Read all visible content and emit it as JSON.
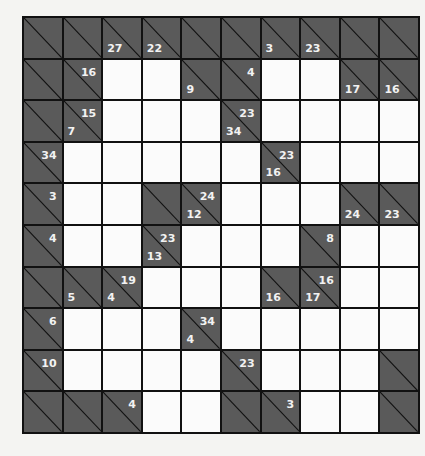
{
  "puzzle": {
    "type": "kakuro",
    "rows": 10,
    "cols": 10,
    "colors": {
      "black_cell": "#5a5a5a",
      "white_cell": "#fbfbfb",
      "grid_line": "#111111",
      "clue_text": "#f2f2f2"
    },
    "grid": [
      [
        {
          "t": "b"
        },
        {
          "t": "b"
        },
        {
          "t": "b",
          "down": "27"
        },
        {
          "t": "b",
          "down": "22"
        },
        {
          "t": "b"
        },
        {
          "t": "b"
        },
        {
          "t": "b",
          "down": "3"
        },
        {
          "t": "b",
          "down": "23"
        },
        {
          "t": "b"
        },
        {
          "t": "b"
        }
      ],
      [
        {
          "t": "b"
        },
        {
          "t": "b",
          "across": "16"
        },
        {
          "t": "w"
        },
        {
          "t": "w"
        },
        {
          "t": "b",
          "down": "9"
        },
        {
          "t": "b",
          "across": "4"
        },
        {
          "t": "w"
        },
        {
          "t": "w"
        },
        {
          "t": "b",
          "down": "17"
        },
        {
          "t": "b",
          "down": "16"
        }
      ],
      [
        {
          "t": "b"
        },
        {
          "t": "b",
          "across": "15",
          "down": "7"
        },
        {
          "t": "w"
        },
        {
          "t": "w"
        },
        {
          "t": "w"
        },
        {
          "t": "b",
          "across": "23",
          "down": "34"
        },
        {
          "t": "w"
        },
        {
          "t": "w"
        },
        {
          "t": "w"
        },
        {
          "t": "w"
        }
      ],
      [
        {
          "t": "b",
          "across": "34"
        },
        {
          "t": "w"
        },
        {
          "t": "w"
        },
        {
          "t": "w"
        },
        {
          "t": "w"
        },
        {
          "t": "w"
        },
        {
          "t": "b",
          "across": "23",
          "down": "16"
        },
        {
          "t": "w"
        },
        {
          "t": "w"
        },
        {
          "t": "w"
        }
      ],
      [
        {
          "t": "b",
          "across": "3"
        },
        {
          "t": "w"
        },
        {
          "t": "w"
        },
        {
          "t": "b"
        },
        {
          "t": "b",
          "across": "24",
          "down": "12"
        },
        {
          "t": "w"
        },
        {
          "t": "w"
        },
        {
          "t": "w"
        },
        {
          "t": "b",
          "down": "24"
        },
        {
          "t": "b",
          "down": "23"
        }
      ],
      [
        {
          "t": "b",
          "across": "4"
        },
        {
          "t": "w"
        },
        {
          "t": "w"
        },
        {
          "t": "b",
          "across": "23",
          "down": "13"
        },
        {
          "t": "w"
        },
        {
          "t": "w"
        },
        {
          "t": "w"
        },
        {
          "t": "b",
          "across": "8"
        },
        {
          "t": "w"
        },
        {
          "t": "w"
        }
      ],
      [
        {
          "t": "b"
        },
        {
          "t": "b",
          "down": "5"
        },
        {
          "t": "b",
          "across": "19",
          "down": "4"
        },
        {
          "t": "w"
        },
        {
          "t": "w"
        },
        {
          "t": "w"
        },
        {
          "t": "b",
          "down": "16"
        },
        {
          "t": "b",
          "across": "16",
          "down": "17"
        },
        {
          "t": "w"
        },
        {
          "t": "w"
        }
      ],
      [
        {
          "t": "b",
          "across": "6"
        },
        {
          "t": "w"
        },
        {
          "t": "w"
        },
        {
          "t": "w"
        },
        {
          "t": "b",
          "across": "34",
          "down": "4"
        },
        {
          "t": "w"
        },
        {
          "t": "w"
        },
        {
          "t": "w"
        },
        {
          "t": "w"
        },
        {
          "t": "w"
        }
      ],
      [
        {
          "t": "b",
          "across": "10"
        },
        {
          "t": "w"
        },
        {
          "t": "w"
        },
        {
          "t": "w"
        },
        {
          "t": "w"
        },
        {
          "t": "b",
          "across": "23"
        },
        {
          "t": "w"
        },
        {
          "t": "w"
        },
        {
          "t": "w"
        },
        {
          "t": "b"
        }
      ],
      [
        {
          "t": "b"
        },
        {
          "t": "b"
        },
        {
          "t": "b",
          "across": "4"
        },
        {
          "t": "w"
        },
        {
          "t": "w"
        },
        {
          "t": "b"
        },
        {
          "t": "b",
          "across": "3"
        },
        {
          "t": "w"
        },
        {
          "t": "w"
        },
        {
          "t": "b"
        }
      ]
    ]
  }
}
